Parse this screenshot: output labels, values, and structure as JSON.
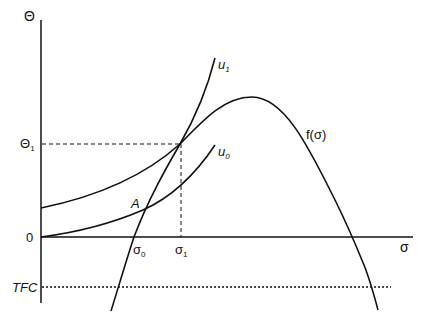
{
  "axes": {
    "y_label": "Θ",
    "x_label": "σ",
    "origin_label": "0"
  },
  "levels": {
    "theta1": {
      "base": "Θ",
      "sub": "1"
    },
    "tfc": "TFC"
  },
  "x_marks": {
    "sigma0": {
      "base": "σ",
      "sub": "0"
    },
    "sigma1": {
      "base": "σ",
      "sub": "1"
    }
  },
  "curves": {
    "u1": {
      "base": "u",
      "sub": "1"
    },
    "u0": {
      "base": "u",
      "sub": "0"
    },
    "f": "f(σ)"
  },
  "points": {
    "A": "A"
  },
  "colors": {
    "line": "#111111",
    "background": "#ffffff"
  }
}
